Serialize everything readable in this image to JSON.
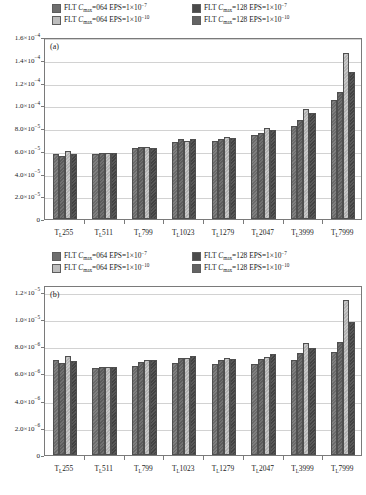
{
  "figure": {
    "panels": [
      "a",
      "b"
    ]
  },
  "legend": {
    "items": [
      {
        "swatch": "dark-gray",
        "prefix": "FLT ",
        "sym": "C",
        "sub": "max",
        "eq": "=064 EPS=1×10",
        "exp": "−7"
      },
      {
        "swatch": "mid-gray",
        "prefix": "FLT ",
        "sym": "C",
        "sub": "max",
        "eq": "=128 EPS=1×10",
        "exp": "−7"
      },
      {
        "swatch": "light-gray",
        "prefix": "FLT ",
        "sym": "C",
        "sub": "max",
        "eq": "=064 EPS=1×10",
        "exp": "−10"
      },
      {
        "swatch": "gray",
        "prefix": "FLT ",
        "sym": "C",
        "sub": "max",
        "eq": "=128 EPS=1×10",
        "exp": "−10"
      }
    ],
    "labels_flat": [
      "FLT Cmax=064 EPS=1×10−7",
      "FLT Cmax=128 EPS=1×10−7",
      "FLT Cmax=064 EPS=1×10−10",
      "FLT Cmax=128 EPS=1×10−10"
    ]
  },
  "chart_data": [
    {
      "type": "bar",
      "panel": "a",
      "title": "(a)",
      "xlabel": "",
      "ylabel": "",
      "grid": true,
      "legend_position": "top",
      "categories": [
        "Tᴸ255",
        "Tᴸ511",
        "Tᴸ799",
        "Tᴸ1023",
        "Tᴸ1279",
        "Tᴸ2047",
        "Tᴸ3999",
        "Tᴸ7999"
      ],
      "category_labels": [
        {
          "base": "T",
          "sub": "L",
          "num": "255"
        },
        {
          "base": "T",
          "sub": "L",
          "num": "511"
        },
        {
          "base": "T",
          "sub": "L",
          "num": "799"
        },
        {
          "base": "T",
          "sub": "L",
          "num": "1023"
        },
        {
          "base": "T",
          "sub": "L",
          "num": "1279"
        },
        {
          "base": "T",
          "sub": "L",
          "num": "2047"
        },
        {
          "base": "T",
          "sub": "L",
          "num": "3999"
        },
        {
          "base": "T",
          "sub": "L",
          "num": "7999"
        }
      ],
      "ylim": [
        0,
        0.00016
      ],
      "yticks": [
        0,
        2e-05,
        4e-05,
        6e-05,
        8e-05,
        0.0001,
        0.00012,
        0.00014,
        0.00016
      ],
      "ytick_labels": [
        {
          "mant": "0",
          "exp": ""
        },
        {
          "mant": "2.0×10",
          "exp": "−5"
        },
        {
          "mant": "4.0×10",
          "exp": "−5"
        },
        {
          "mant": "6.0×10",
          "exp": "−5"
        },
        {
          "mant": "8.0×10",
          "exp": "−5"
        },
        {
          "mant": "1.0×10",
          "exp": "−4"
        },
        {
          "mant": "1.2×10",
          "exp": "−4"
        },
        {
          "mant": "1.4×10",
          "exp": "−4"
        },
        {
          "mant": "1.6×10",
          "exp": "−4"
        }
      ],
      "series": [
        {
          "name": "FLT Cmax=064 EPS=1×10−7",
          "values": [
            5.7e-05,
            5.75e-05,
            6.2e-05,
            6.8e-05,
            6.9e-05,
            7.4e-05,
            8.2e-05,
            0.000105
          ]
        },
        {
          "name": "FLT Cmax=128 EPS=1×10−7",
          "values": [
            5.5e-05,
            5.77e-05,
            6.3e-05,
            7e-05,
            7e-05,
            7.6e-05,
            8.7e-05,
            0.000112
          ]
        },
        {
          "name": "FLT Cmax=064 EPS=1×10−10",
          "values": [
            6e-05,
            5.78e-05,
            6.32e-05,
            6.85e-05,
            7.2e-05,
            8e-05,
            9.7e-05,
            0.000146
          ]
        },
        {
          "name": "FLT Cmax=128 EPS=1×10−10",
          "values": [
            5.75e-05,
            5.78e-05,
            6.2e-05,
            7e-05,
            7.1e-05,
            7.8e-05,
            9.3e-05,
            0.000129
          ]
        }
      ]
    },
    {
      "type": "bar",
      "panel": "b",
      "title": "(b)",
      "xlabel": "",
      "ylabel": "",
      "grid": true,
      "legend_position": "top",
      "categories": [
        "Tᴸ255",
        "Tᴸ511",
        "Tᴸ799",
        "Tᴸ1023",
        "Tᴸ1279",
        "Tᴸ2047",
        "Tᴸ3999",
        "Tᴸ7999"
      ],
      "category_labels": [
        {
          "base": "T",
          "sub": "L",
          "num": "255"
        },
        {
          "base": "T",
          "sub": "L",
          "num": "511"
        },
        {
          "base": "T",
          "sub": "L",
          "num": "799"
        },
        {
          "base": "T",
          "sub": "L",
          "num": "1023"
        },
        {
          "base": "T",
          "sub": "L",
          "num": "1279"
        },
        {
          "base": "T",
          "sub": "L",
          "num": "2047"
        },
        {
          "base": "T",
          "sub": "L",
          "num": "3999"
        },
        {
          "base": "T",
          "sub": "L",
          "num": "7999"
        }
      ],
      "ylim": [
        0,
        1.25e-05
      ],
      "yticks": [
        0,
        2e-06,
        4e-06,
        6e-06,
        8e-06,
        1e-05,
        1.2e-05
      ],
      "ytick_labels": [
        {
          "mant": "0",
          "exp": ""
        },
        {
          "mant": "2.0×10",
          "exp": "−6"
        },
        {
          "mant": "4.0×10",
          "exp": "−6"
        },
        {
          "mant": "6.0×10",
          "exp": "−6"
        },
        {
          "mant": "8.0×10",
          "exp": "−6"
        },
        {
          "mant": "1.0×10",
          "exp": "−5"
        },
        {
          "mant": "1.2×10",
          "exp": "−5"
        }
      ],
      "series": [
        {
          "name": "FLT Cmax=064 EPS=1×10−7",
          "values": [
            7e-06,
            6.38e-06,
            6.55e-06,
            6.8e-06,
            6.72e-06,
            6.72e-06,
            7e-06,
            7.6e-06
          ]
        },
        {
          "name": "FLT Cmax=128 EPS=1×10−7",
          "values": [
            6.75e-06,
            6.45e-06,
            6.85e-06,
            7.15e-06,
            7e-06,
            7.05e-06,
            7.5e-06,
            8.3e-06
          ]
        },
        {
          "name": "FLT Cmax=064 EPS=1×10−10",
          "values": [
            7.3e-06,
            6.45e-06,
            7e-06,
            7.1e-06,
            7.15e-06,
            7.2e-06,
            8.2e-06,
            1.14e-05
          ]
        },
        {
          "name": "FLT Cmax=128 EPS=1×10−10",
          "values": [
            6.9e-06,
            6.45e-06,
            6.95e-06,
            7.3e-06,
            7.05e-06,
            7.4e-06,
            7.9e-06,
            9.8e-06
          ]
        }
      ]
    }
  ],
  "colors": {
    "series1": "#6e6e6e",
    "series2": "#bdbdbd",
    "series3": "#4a4a4a",
    "series4": "#636363",
    "grid": "#d2d2d2",
    "frame": "#7a7a7a",
    "text": "#1a1a1a"
  }
}
